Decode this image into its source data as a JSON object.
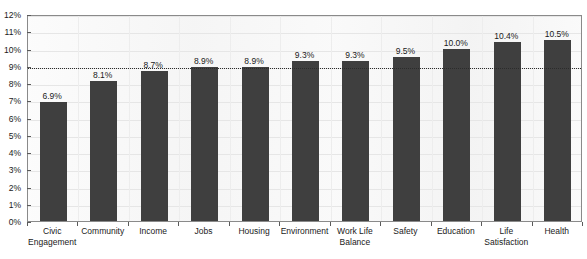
{
  "chart_data": {
    "type": "bar",
    "title": "",
    "xlabel": "",
    "ylabel": "",
    "ylim": [
      0,
      12
    ],
    "ytick_step": 1,
    "ytick_labels": [
      "12%",
      "11%",
      "10%",
      "9%",
      "8%",
      "7%",
      "6%",
      "5%",
      "4%",
      "3%",
      "2%",
      "1%",
      "0%"
    ],
    "ytick_values": [
      12,
      11,
      10,
      9,
      8,
      7,
      6,
      5,
      4,
      3,
      2,
      1,
      0
    ],
    "grid": true,
    "legend": "none",
    "categories": [
      "Civic Engagement",
      "Community",
      "Income",
      "Jobs",
      "Housing",
      "Environment",
      "Work Life Balance",
      "Safety",
      "Education",
      "Life Satisfaction",
      "Health"
    ],
    "category_lines": [
      [
        "Civic",
        "Engagement"
      ],
      [
        "Community",
        ""
      ],
      [
        "Income",
        ""
      ],
      [
        "Jobs",
        ""
      ],
      [
        "Housing",
        ""
      ],
      [
        "Environment",
        ""
      ],
      [
        "Work Life",
        "Balance"
      ],
      [
        "Safety",
        ""
      ],
      [
        "Education",
        ""
      ],
      [
        "Life",
        "Satisfaction"
      ],
      [
        "Health",
        ""
      ]
    ],
    "values": [
      6.9,
      8.1,
      8.7,
      8.9,
      8.9,
      9.3,
      9.3,
      9.5,
      10.0,
      10.4,
      10.5
    ],
    "data_labels": [
      "6.9%",
      "8.1%",
      "8.7%",
      "8.9%",
      "8.9%",
      "9.3%",
      "9.3%",
      "9.5%",
      "10.0%",
      "10.4%",
      "10.5%"
    ],
    "reference_line": {
      "value": 9,
      "label": "",
      "style": "dotted"
    },
    "colors": {
      "bar": "#3f3f3f",
      "plot_background": "#f7f7f7",
      "gridline": "#e6e6e6",
      "axis": "#8a8a8a",
      "reference_line": "#2b2b2b",
      "text": "#1a1a1a"
    }
  }
}
